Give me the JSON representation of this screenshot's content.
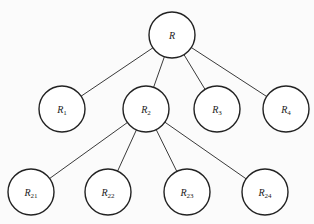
{
  "diagram": {
    "type": "tree",
    "colors": {
      "background": "#fbfbfb",
      "node_fill": "#ffffff",
      "node_stroke": "#222222",
      "edge": "#3a3a3a",
      "text": "#222222"
    },
    "node_radius": 23,
    "nodes": [
      {
        "id": "R",
        "base": "R",
        "sub": "",
        "cx": 172,
        "cy": 35
      },
      {
        "id": "R1",
        "base": "R",
        "sub": "1",
        "cx": 62,
        "cy": 109
      },
      {
        "id": "R2",
        "base": "R",
        "sub": "2",
        "cx": 146,
        "cy": 109
      },
      {
        "id": "R3",
        "base": "R",
        "sub": "3",
        "cx": 217,
        "cy": 109
      },
      {
        "id": "R4",
        "base": "R",
        "sub": "4",
        "cx": 286,
        "cy": 109
      },
      {
        "id": "R21",
        "base": "R",
        "sub": "21",
        "cx": 31,
        "cy": 192
      },
      {
        "id": "R22",
        "base": "R",
        "sub": "22",
        "cx": 108,
        "cy": 192
      },
      {
        "id": "R23",
        "base": "R",
        "sub": "23",
        "cx": 187,
        "cy": 192
      },
      {
        "id": "R24",
        "base": "R",
        "sub": "24",
        "cx": 265,
        "cy": 192
      }
    ],
    "edges": [
      {
        "from": "R",
        "to": "R1"
      },
      {
        "from": "R",
        "to": "R2"
      },
      {
        "from": "R",
        "to": "R3"
      },
      {
        "from": "R",
        "to": "R4"
      },
      {
        "from": "R2",
        "to": "R21"
      },
      {
        "from": "R2",
        "to": "R22"
      },
      {
        "from": "R2",
        "to": "R23"
      },
      {
        "from": "R2",
        "to": "R24"
      }
    ]
  }
}
